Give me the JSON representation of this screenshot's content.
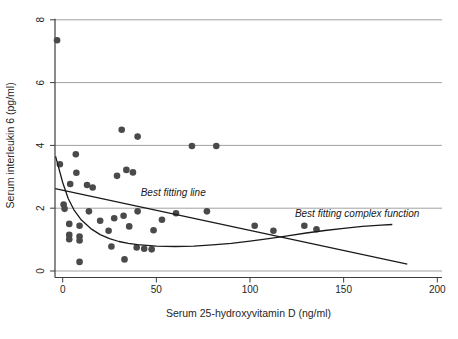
{
  "figure": {
    "background": "#ffffff"
  },
  "chart_data": {
    "type": "scatter",
    "title": "",
    "xlabel": "Serum 25-hydroxyvitamin D (ng/ml)",
    "ylabel": "Serum interleukin 6 (pg/ml)",
    "xlim": [
      -4,
      203
    ],
    "ylim": [
      0,
      8.2
    ],
    "x_ticks": [
      0,
      50,
      100,
      150,
      200
    ],
    "y_ticks": [
      0,
      2,
      4,
      6,
      8
    ],
    "grid": "horizontal-only",
    "legend": "none",
    "colors": {
      "point": "#4a4a4a",
      "fit_line": "#1a1a1a",
      "gridline": "#969696",
      "axis": "#3d3d3d",
      "text": "#262626"
    },
    "series": [
      {
        "name": "observations",
        "kind": "scatter",
        "marker": "filled-circle",
        "points": [
          [
            -3,
            7.35
          ],
          [
            -1.5,
            3.4
          ],
          [
            7,
            3.72
          ],
          [
            7.3,
            3.13
          ],
          [
            4,
            2.77
          ],
          [
            13,
            2.74
          ],
          [
            16,
            2.66
          ],
          [
            29,
            3.03
          ],
          [
            34,
            3.22
          ],
          [
            37.5,
            3.14
          ],
          [
            31.5,
            4.5
          ],
          [
            40,
            4.28
          ],
          [
            69,
            3.98
          ],
          [
            82,
            3.98
          ],
          [
            0.5,
            2.12
          ],
          [
            1,
            1.98
          ],
          [
            14,
            1.9
          ],
          [
            20,
            1.6
          ],
          [
            27.5,
            1.68
          ],
          [
            32.5,
            1.76
          ],
          [
            40,
            1.9
          ],
          [
            53,
            1.63
          ],
          [
            60.5,
            1.84
          ],
          [
            77,
            1.9
          ],
          [
            3.5,
            1.5
          ],
          [
            9,
            1.44
          ],
          [
            3.5,
            1.15
          ],
          [
            9,
            1.1
          ],
          [
            3.5,
            1.01
          ],
          [
            9,
            0.97
          ],
          [
            24.5,
            1.28
          ],
          [
            35.5,
            1.42
          ],
          [
            48.5,
            1.3
          ],
          [
            26,
            0.78
          ],
          [
            39.5,
            0.75
          ],
          [
            43.5,
            0.71
          ],
          [
            47.5,
            0.69
          ],
          [
            9,
            0.29
          ],
          [
            33,
            0.37
          ],
          [
            102.5,
            1.44
          ],
          [
            112.5,
            1.28
          ],
          [
            129,
            1.44
          ],
          [
            135.5,
            1.33
          ]
        ]
      },
      {
        "name": "best-fitting-line",
        "kind": "line",
        "points": [
          [
            -4,
            2.62
          ],
          [
            184,
            0.22
          ]
        ]
      },
      {
        "name": "best-fitting-complex-function",
        "kind": "line",
        "points": [
          [
            -3.8,
            3.65
          ],
          [
            0,
            2.82
          ],
          [
            3,
            2.3
          ],
          [
            6,
            1.95
          ],
          [
            10,
            1.62
          ],
          [
            15,
            1.35
          ],
          [
            20,
            1.16
          ],
          [
            25,
            1.03
          ],
          [
            30,
            0.94
          ],
          [
            35,
            0.88
          ],
          [
            40,
            0.84
          ],
          [
            50,
            0.79
          ],
          [
            60,
            0.78
          ],
          [
            70,
            0.79
          ],
          [
            80,
            0.83
          ],
          [
            90,
            0.88
          ],
          [
            100,
            0.95
          ],
          [
            110,
            1.03
          ],
          [
            120,
            1.12
          ],
          [
            130,
            1.21
          ],
          [
            140,
            1.29
          ],
          [
            150,
            1.36
          ],
          [
            160,
            1.42
          ],
          [
            170,
            1.46
          ],
          [
            176,
            1.48
          ]
        ]
      }
    ],
    "annotations": [
      {
        "text": "Best fitting line",
        "x": 59,
        "y": 2.5,
        "style": "italic"
      },
      {
        "text": "Best fitting complex function",
        "x": 157.2,
        "y": 1.83,
        "style": "italic"
      }
    ]
  }
}
